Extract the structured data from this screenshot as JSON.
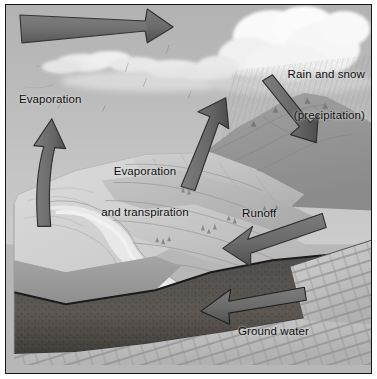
{
  "figure": {
    "style": "grayscale landscape block-diagram illustration",
    "width": 377,
    "height": 379,
    "border_color": "#161616"
  },
  "labels": {
    "precipitation": {
      "line1": "Rain and snow",
      "line2": "(precipitation)"
    },
    "evaporation": "Evaporation",
    "evaporation_transpiration": {
      "line1": "Evaporation",
      "line2": "and transpiration"
    },
    "runoff": "Runoff",
    "ground_water": "Ground water"
  },
  "arrows": [
    {
      "name": "atmospheric-transport-arrow",
      "direction": "right",
      "label": ""
    },
    {
      "name": "evaporation-arrow",
      "direction": "up",
      "label": "Evaporation"
    },
    {
      "name": "evaporation-transpiration-arrow",
      "direction": "up-left",
      "label": "Evaporation and transpiration"
    },
    {
      "name": "precipitation-arrow",
      "direction": "down-left",
      "label": "Rain and snow (precipitation)"
    },
    {
      "name": "runoff-arrow",
      "direction": "down-left",
      "label": "Runoff"
    },
    {
      "name": "ground-water-arrow",
      "direction": "left",
      "label": "Ground water"
    }
  ],
  "scene_elements": [
    {
      "name": "sky",
      "tone": "#b9b9b9"
    },
    {
      "name": "cumulus-cloud",
      "tone": "#fdfdfd"
    },
    {
      "name": "rain-streaks",
      "tone": "#8e8e8e"
    },
    {
      "name": "mountain-ridge",
      "tone": "#9a9a9a"
    },
    {
      "name": "hill-slopes",
      "tone": "#c6c6c6"
    },
    {
      "name": "river-valley",
      "tone": "#ededed"
    },
    {
      "name": "lake-water",
      "tone": "#9e9e9e"
    },
    {
      "name": "soil-layer",
      "tone": "#4c4c4c"
    },
    {
      "name": "bedrock",
      "tone": "#c9c9c9"
    }
  ],
  "colors": {
    "arrow_fill": "#6e6e6e",
    "arrow_edge": "#2b2b2b",
    "sky": "#b9b9b9",
    "text": "#0d0d0d"
  }
}
